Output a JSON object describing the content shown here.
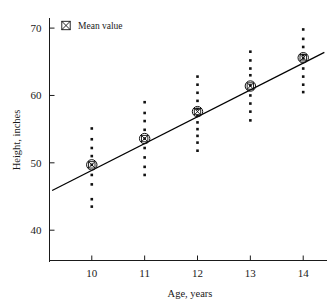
{
  "chart_data": {
    "type": "scatter",
    "title": "",
    "xlabel": "Age, years",
    "ylabel": "Height, inches",
    "xlim": [
      9.2,
      14.45
    ],
    "ylim": [
      35.5,
      71.5
    ],
    "xticks": [
      10,
      11,
      12,
      13,
      14
    ],
    "xtick_labels": [
      "10",
      "11",
      "12",
      "13",
      "14"
    ],
    "yticks": [
      40,
      50,
      60,
      70
    ],
    "ytick_labels": [
      "40",
      "50",
      "60",
      "70"
    ],
    "grid": false,
    "legend": {
      "position": "top-left-inside",
      "entries": [
        {
          "label": "Mean value",
          "marker": "circled-crossed-square"
        }
      ]
    },
    "series": [
      {
        "name": "Individual heights",
        "marker": "small-filled-square",
        "color": "#111111",
        "points": [
          {
            "x": 10,
            "y": 55.1
          },
          {
            "x": 10,
            "y": 53.5
          },
          {
            "x": 10,
            "y": 52.2
          },
          {
            "x": 10,
            "y": 51.0
          },
          {
            "x": 10,
            "y": 49.7
          },
          {
            "x": 10,
            "y": 48.2
          },
          {
            "x": 10,
            "y": 46.8
          },
          {
            "x": 10,
            "y": 44.6
          },
          {
            "x": 10,
            "y": 43.5
          },
          {
            "x": 11,
            "y": 59.0
          },
          {
            "x": 11,
            "y": 57.4
          },
          {
            "x": 11,
            "y": 56.2
          },
          {
            "x": 11,
            "y": 54.9
          },
          {
            "x": 11,
            "y": 53.6
          },
          {
            "x": 11,
            "y": 52.2
          },
          {
            "x": 11,
            "y": 50.8
          },
          {
            "x": 11,
            "y": 49.4
          },
          {
            "x": 11,
            "y": 48.2
          },
          {
            "x": 12,
            "y": 62.8
          },
          {
            "x": 12,
            "y": 61.6
          },
          {
            "x": 12,
            "y": 60.4
          },
          {
            "x": 12,
            "y": 59.2
          },
          {
            "x": 12,
            "y": 58.0
          },
          {
            "x": 12,
            "y": 57.0
          },
          {
            "x": 12,
            "y": 56.0
          },
          {
            "x": 12,
            "y": 55.0
          },
          {
            "x": 12,
            "y": 54.0
          },
          {
            "x": 12,
            "y": 53.0
          },
          {
            "x": 12,
            "y": 51.8
          },
          {
            "x": 13,
            "y": 66.5
          },
          {
            "x": 13,
            "y": 65.2
          },
          {
            "x": 13,
            "y": 64.0
          },
          {
            "x": 13,
            "y": 63.0
          },
          {
            "x": 13,
            "y": 61.5
          },
          {
            "x": 13,
            "y": 60.0
          },
          {
            "x": 13,
            "y": 58.8
          },
          {
            "x": 13,
            "y": 57.6
          },
          {
            "x": 13,
            "y": 56.3
          },
          {
            "x": 14,
            "y": 69.8
          },
          {
            "x": 14,
            "y": 68.4
          },
          {
            "x": 14,
            "y": 67.2
          },
          {
            "x": 14,
            "y": 66.0
          },
          {
            "x": 14,
            "y": 65.5
          },
          {
            "x": 14,
            "y": 64.0
          },
          {
            "x": 14,
            "y": 62.8
          },
          {
            "x": 14,
            "y": 61.6
          },
          {
            "x": 14,
            "y": 60.5
          }
        ]
      },
      {
        "name": "Mean value",
        "marker": "circled-crossed-square",
        "color": "#111111",
        "points": [
          {
            "x": 10,
            "y": 49.7
          },
          {
            "x": 11,
            "y": 53.6
          },
          {
            "x": 12,
            "y": 57.6
          },
          {
            "x": 13,
            "y": 61.4
          },
          {
            "x": 14,
            "y": 65.6
          }
        ]
      }
    ],
    "fit_line": {
      "name": "Least-squares regression line",
      "x_start": 9.25,
      "y_start": 45.9,
      "x_end": 14.4,
      "y_end": 66.4,
      "slope": 3.98,
      "intercept": 9.1
    }
  }
}
